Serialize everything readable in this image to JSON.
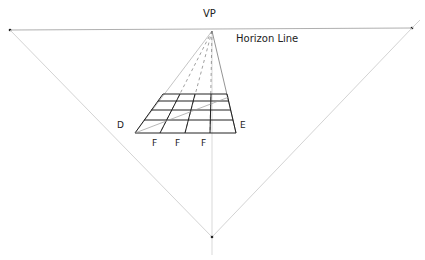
{
  "labels": {
    "vp": "VP",
    "horizon": "Horizon Line",
    "d": "D",
    "e": "E",
    "f1": "F",
    "f2": "F",
    "f3": "F"
  },
  "colors": {
    "ink": "#222222",
    "guide": "#c8c8c8",
    "horizon": "#9a9a9a",
    "dash": "#777777"
  },
  "points": {
    "vanishing_point": [
      212,
      31
    ],
    "horizon_left": [
      10,
      30
    ],
    "horizon_right": [
      412,
      28
    ],
    "bottom_point": [
      212,
      237
    ]
  },
  "grid": {
    "rows_y": [
      94,
      101,
      110,
      120,
      133
    ],
    "top_x": [
      163,
      180,
      195,
      211,
      227
    ],
    "bottom_x": [
      135,
      160,
      185,
      210,
      236
    ]
  }
}
